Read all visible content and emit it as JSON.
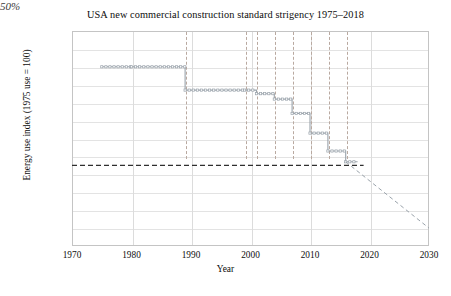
{
  "chart_data": {
    "type": "line",
    "title": "USA new commercial construction standard strigency 1975–2018",
    "xlabel": "Year",
    "ylabel": "Energy use index (1975 use = 100)",
    "xlim": [
      1970,
      2030
    ],
    "ylim": [
      0,
      120
    ],
    "xticks": [
      "1970",
      "1980",
      "1990",
      "2000",
      "2010",
      "2020",
      "2030"
    ],
    "yticks": [
      "0%",
      "10%",
      "20%",
      "30%",
      "40%",
      "50%",
      "60%",
      "70%",
      "80%",
      "90%",
      "100%",
      "110%",
      "120%"
    ],
    "grid": "both",
    "legend": "none",
    "series": [
      {
        "name": "ASHRAE 90.1 standard stringency (step line)",
        "x": [
          1975,
          1980,
          1989,
          1999,
          2001,
          2004,
          2007,
          2010,
          2013,
          2016
        ],
        "values": [
          100,
          100,
          87,
          87,
          85,
          82,
          74,
          63,
          53,
          47
        ]
      },
      {
        "name": "projection to goal",
        "x": [
          2016,
          2030
        ],
        "values": [
          47,
          10
        ],
        "style": "dashed"
      }
    ],
    "reference_lines": [
      {
        "orientation": "horizontal",
        "value": 45,
        "style": "dashed",
        "label": ""
      }
    ],
    "point_labels": [
      {
        "text": "90.1-1975",
        "x": 1975,
        "y": 100
      },
      {
        "text": "90A-1980",
        "x": 1980,
        "y": 100
      },
      {
        "text": "90.1-1989",
        "x": 1989,
        "y": 87
      },
      {
        "text": "90.1-1999",
        "x": 1999,
        "y": 87
      },
      {
        "text": "90.1-2001",
        "x": 2001,
        "y": 85
      },
      {
        "text": "90.1-2004",
        "x": 2004,
        "y": 82
      },
      {
        "text": "90.1-2007",
        "x": 2007,
        "y": 74
      },
      {
        "text": "90.1-2010",
        "x": 2010,
        "y": 63
      },
      {
        "text": "90.1-2013",
        "x": 2013,
        "y": 53
      },
      {
        "text": "90.1-2016",
        "x": 2016,
        "y": 47
      },
      {
        "text": "(goal)",
        "x": 2019,
        "y": 45
      }
    ],
    "annotations": [
      {
        "text": "50%",
        "x": 1977,
        "y": 60,
        "style": "italic"
      }
    ],
    "revision_markers": [
      {
        "year": 1984,
        "direction": "down"
      },
      {
        "year": 1994,
        "direction": "down"
      },
      {
        "year": 2000,
        "direction": "down"
      },
      {
        "year": 2002,
        "direction": "up"
      },
      {
        "year": 2003,
        "direction": "down"
      },
      {
        "year": 2006,
        "direction": "down"
      },
      {
        "year": 2009,
        "direction": "down"
      },
      {
        "year": 2012,
        "direction": "down"
      }
    ],
    "dashed_vertical_years": [
      1989,
      1999,
      2001,
      2004,
      2007,
      2010,
      2013,
      2016
    ],
    "colors": {
      "series": "#9aa3ab",
      "arrow_fill": "#9a9a9a",
      "arrow_stroke": "#6f6f6f",
      "grid": "#e3e3e3",
      "frame": "#c4c4c4",
      "reference": "#2f2f2f",
      "vertical_dash": "#b9a9a0",
      "text": "#0d0d0d"
    }
  }
}
